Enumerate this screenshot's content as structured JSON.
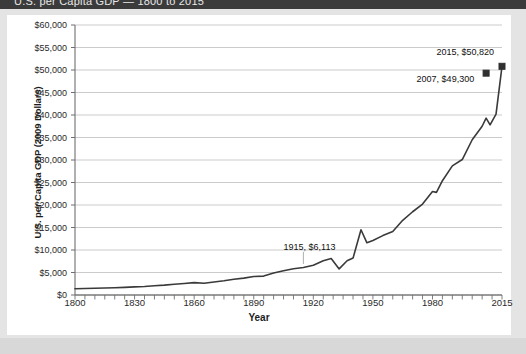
{
  "window": {
    "top_bar_text": "U.S. per Capita GDP — 1800 to 2015"
  },
  "chart_data": {
    "type": "line",
    "title": "",
    "xlabel": "Year",
    "ylabel": "U.S. per Capita GDP (2009 Dollars)",
    "xlim": [
      1800,
      2015
    ],
    "ylim": [
      0,
      60000
    ],
    "grid": true,
    "legend": "none",
    "line_color": "#3a3a3a",
    "marker_color": "#2f2f2f",
    "y_tick_labels": [
      "$60,000",
      "$55,000",
      "$50,000",
      "$45,000",
      "$40,000",
      "$35,000",
      "$30,000",
      "$25,000",
      "$20,000",
      "$15,000",
      "$10,000",
      "$5,000",
      "$0"
    ],
    "y_tick_values": [
      60000,
      55000,
      50000,
      45000,
      40000,
      35000,
      30000,
      25000,
      20000,
      15000,
      10000,
      5000,
      0
    ],
    "x_tick_labels": [
      "1800",
      "1830",
      "1860",
      "1890",
      "1920",
      "1950",
      "1980",
      "2015"
    ],
    "x_tick_values": [
      1800,
      1830,
      1860,
      1890,
      1920,
      1950,
      1980,
      2015
    ],
    "x_minor_tick_step": 5,
    "annotations": [
      {
        "text": "1915, $6,113",
        "x": 1915,
        "y": 6113,
        "label_x": 1905,
        "label_y": 10500
      },
      {
        "text": "2007, $49,300",
        "x": 2007,
        "y": 49300,
        "label_x": 1972,
        "label_y": 47800
      },
      {
        "text": "2015, $50,820",
        "x": 2015,
        "y": 50820,
        "label_x": 1982,
        "label_y": 53800
      }
    ],
    "markers": [
      {
        "x": 2007,
        "y": 49300
      },
      {
        "x": 2015,
        "y": 50820
      }
    ],
    "x": [
      1800,
      1805,
      1810,
      1815,
      1820,
      1825,
      1830,
      1835,
      1840,
      1845,
      1850,
      1855,
      1860,
      1865,
      1870,
      1875,
      1880,
      1885,
      1890,
      1895,
      1900,
      1905,
      1910,
      1915,
      1920,
      1925,
      1929,
      1933,
      1937,
      1940,
      1944,
      1947,
      1950,
      1955,
      1960,
      1965,
      1970,
      1975,
      1980,
      1982,
      1985,
      1990,
      1995,
      2000,
      2005,
      2007,
      2009,
      2012,
      2015
    ],
    "y": [
      1400,
      1450,
      1500,
      1560,
      1620,
      1700,
      1800,
      1900,
      2050,
      2200,
      2400,
      2550,
      2750,
      2600,
      2900,
      3150,
      3500,
      3750,
      4100,
      4200,
      4900,
      5400,
      5850,
      6113,
      6600,
      7600,
      8100,
      5800,
      7600,
      8200,
      14500,
      11600,
      12100,
      13200,
      14100,
      16600,
      18500,
      20200,
      23000,
      22800,
      25400,
      28700,
      30100,
      34500,
      37500,
      39300,
      37800,
      40200,
      50820
    ],
    "note": "Series approximates U.S. real per-capita GDP in 2009 dollars; annotated endpoint values 2007=$49,300 and 2015=$50,820 are the figure's stated callouts."
  }
}
